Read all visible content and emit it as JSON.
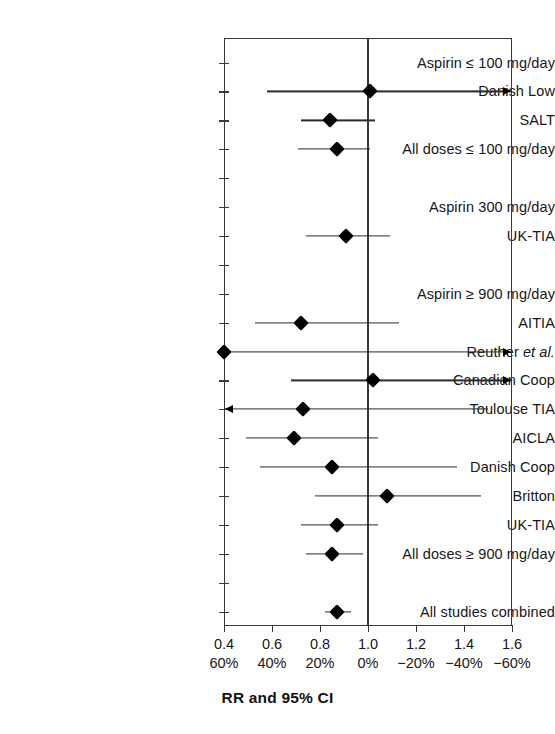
{
  "figure": {
    "axis_title": "RR and 95% CI",
    "x_axis": {
      "ticks_rr": [
        "0.4",
        "0.6",
        "0.8",
        "1.0",
        "1.2",
        "1.4",
        "1.6"
      ],
      "ticks_pct": [
        "60%",
        "40%",
        "20%",
        "0%",
        "−20%",
        "−40%",
        "−60%"
      ],
      "min": 0.4,
      "max": 1.6,
      "null_value": 1.0
    }
  },
  "chart_data": {
    "type": "forest",
    "title": "",
    "xlabel": "RR and 95% CI",
    "ylabel": "",
    "xlim": [
      0.4,
      1.6
    ],
    "reference_line": 1.0,
    "grid": false,
    "legend": "none",
    "x_tick_labels_primary": [
      "0.4",
      "0.6",
      "0.8",
      "1.0",
      "1.2",
      "1.4",
      "1.6"
    ],
    "x_tick_labels_secondary": [
      "60%",
      "40%",
      "20%",
      "0%",
      "−20%",
      "−40%",
      "−60%"
    ],
    "rows": [
      {
        "label": "Aspirin ≤ 100 mg/day",
        "type": "heading",
        "rr": null,
        "ci_low": null,
        "ci_high": null,
        "arrow_left": false,
        "arrow_right": false
      },
      {
        "label": "Danish Low",
        "type": "study",
        "rr": 1.01,
        "ci_low": 0.58,
        "ci_high": 1.62,
        "arrow_left": false,
        "arrow_right": true
      },
      {
        "label": "SALT",
        "type": "study",
        "rr": 0.84,
        "ci_low": 0.72,
        "ci_high": 1.03,
        "arrow_left": false,
        "arrow_right": false
      },
      {
        "label": "All doses ≤ 100 mg/day",
        "type": "summary",
        "rr": 0.87,
        "ci_low": 0.71,
        "ci_high": 1.01,
        "arrow_left": false,
        "arrow_right": false
      },
      {
        "label": "",
        "type": "spacer",
        "rr": null,
        "ci_low": null,
        "ci_high": null,
        "arrow_left": false,
        "arrow_right": false
      },
      {
        "label": "Aspirin 300 mg/day",
        "type": "heading",
        "rr": null,
        "ci_low": null,
        "ci_high": null,
        "arrow_left": false,
        "arrow_right": false
      },
      {
        "label": "UK-TIA",
        "type": "study",
        "rr": 0.91,
        "ci_low": 0.74,
        "ci_high": 1.09,
        "arrow_left": false,
        "arrow_right": false
      },
      {
        "label": "",
        "type": "spacer",
        "rr": null,
        "ci_low": null,
        "ci_high": null,
        "arrow_left": false,
        "arrow_right": false
      },
      {
        "label": "Aspirin ≥ 900 mg/day",
        "type": "heading",
        "rr": null,
        "ci_low": null,
        "ci_high": null,
        "arrow_left": false,
        "arrow_right": false
      },
      {
        "label": "AITIA",
        "type": "study",
        "rr": 0.72,
        "ci_low": 0.53,
        "ci_high": 1.13,
        "arrow_left": false,
        "arrow_right": false
      },
      {
        "label": "Reuther et al.",
        "label_italic_from": 8,
        "type": "study",
        "rr": 0.4,
        "ci_low": 0.4,
        "ci_high": 1.62,
        "arrow_left": false,
        "arrow_right": true
      },
      {
        "label": "Canadian Coop",
        "type": "study",
        "rr": 1.02,
        "ci_low": 0.68,
        "ci_high": 1.62,
        "arrow_left": false,
        "arrow_right": true
      },
      {
        "label": "Toulouse TIA",
        "type": "study",
        "rr": 0.73,
        "ci_low": 0.38,
        "ci_high": 1.5,
        "arrow_left": true,
        "arrow_right": false
      },
      {
        "label": "AICLA",
        "type": "study",
        "rr": 0.69,
        "ci_low": 0.49,
        "ci_high": 1.04,
        "arrow_left": false,
        "arrow_right": false
      },
      {
        "label": "Danish Coop",
        "type": "study",
        "rr": 0.85,
        "ci_low": 0.55,
        "ci_high": 1.37,
        "arrow_left": false,
        "arrow_right": false
      },
      {
        "label": "Britton",
        "type": "study",
        "rr": 1.08,
        "ci_low": 0.78,
        "ci_high": 1.47,
        "arrow_left": false,
        "arrow_right": false
      },
      {
        "label": "UK-TIA",
        "type": "study",
        "rr": 0.87,
        "ci_low": 0.72,
        "ci_high": 1.04,
        "arrow_left": false,
        "arrow_right": false
      },
      {
        "label": "All doses ≥ 900 mg/day",
        "type": "summary",
        "rr": 0.85,
        "ci_low": 0.74,
        "ci_high": 0.98,
        "arrow_left": false,
        "arrow_right": false
      },
      {
        "label": "",
        "type": "spacer",
        "rr": null,
        "ci_low": null,
        "ci_high": null,
        "arrow_left": false,
        "arrow_right": false
      },
      {
        "label": "All studies combined",
        "type": "summary",
        "rr": 0.87,
        "ci_low": 0.82,
        "ci_high": 0.93,
        "arrow_left": false,
        "arrow_right": false
      }
    ]
  }
}
